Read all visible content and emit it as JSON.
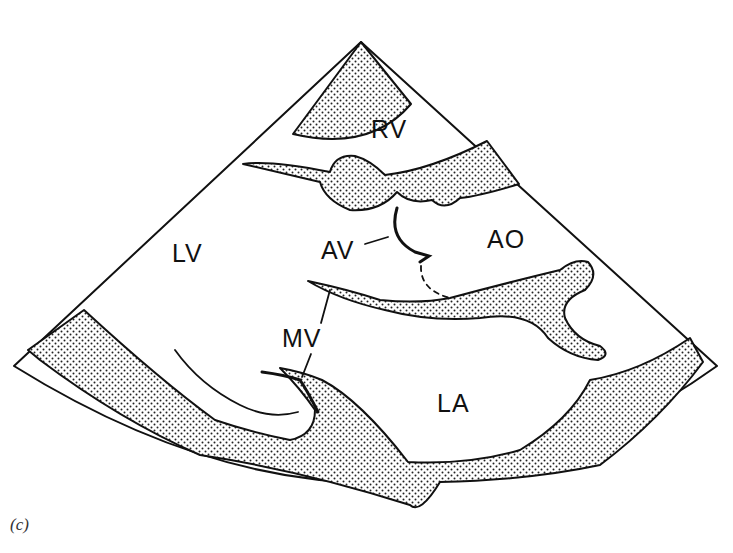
{
  "figure": {
    "caption": "(c)",
    "view": "parasternal long-axis echocardiogram schematic",
    "labels": {
      "rv": "RV",
      "lv": "LV",
      "av": "AV",
      "ao": "AO",
      "mv": "MV",
      "la": "LA"
    }
  }
}
